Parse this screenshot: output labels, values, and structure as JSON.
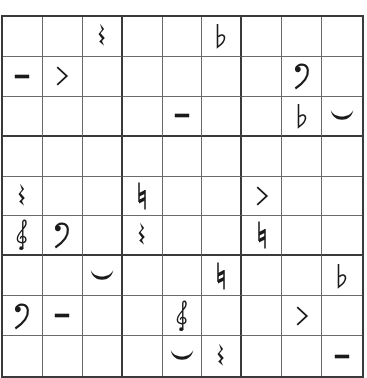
{
  "puzzle": {
    "type": "music-symbol-sudoku",
    "size": 9,
    "symbols": {
      "rest": "quarter-rest",
      "flat": "flat",
      "dash": "tenuto",
      "accent": "accent",
      "bass": "bass-clef",
      "tie": "tie",
      "natural": "natural",
      "treble": "treble-clef"
    },
    "grid": [
      [
        "",
        "",
        "rest",
        "",
        "",
        "flat",
        "",
        "",
        ""
      ],
      [
        "dash",
        "accent",
        "",
        "",
        "",
        "",
        "",
        "bass",
        ""
      ],
      [
        "",
        "",
        "",
        "",
        "dash",
        "",
        "",
        "flat",
        "tie"
      ],
      [
        "",
        "",
        "",
        "",
        "",
        "",
        "",
        "",
        ""
      ],
      [
        "rest",
        "",
        "",
        "natural",
        "",
        "",
        "accent",
        "",
        ""
      ],
      [
        "treble",
        "bass",
        "",
        "rest",
        "",
        "",
        "natural",
        "",
        ""
      ],
      [
        "",
        "",
        "tie",
        "",
        "",
        "natural",
        "",
        "",
        "flat"
      ],
      [
        "bass",
        "dash",
        "",
        "",
        "treble",
        "",
        "",
        "accent",
        ""
      ],
      [
        "",
        "",
        "",
        "",
        "tie",
        "rest",
        "",
        "",
        "dash"
      ]
    ]
  }
}
